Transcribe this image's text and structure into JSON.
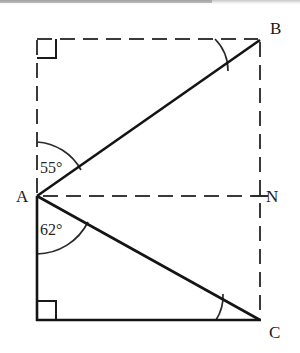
{
  "figure": {
    "kind": "geometry-diagram",
    "title": "",
    "background_color": "#ffffff",
    "stroke_color": "#1a1a1a",
    "dashed_color": "#3a3a3a",
    "vertices": [
      {
        "id": "A",
        "label": "A",
        "x": 37,
        "y": 196
      },
      {
        "id": "B",
        "label": "B",
        "x": 260,
        "y": 40
      },
      {
        "id": "C",
        "label": "C",
        "x": 260,
        "y": 320
      },
      {
        "id": "N",
        "label": "N",
        "x": 260,
        "y": 196
      },
      {
        "id": "T",
        "label": "",
        "x": 37,
        "y": 39
      },
      {
        "id": "D",
        "label": "",
        "x": 37,
        "y": 320
      }
    ],
    "solid_segments": [
      {
        "name": "segment-AB",
        "from": "A",
        "to": "B"
      },
      {
        "name": "segment-AC",
        "from": "A",
        "to": "C"
      },
      {
        "name": "segment-AD",
        "from": "A",
        "to": "D"
      },
      {
        "name": "segment-DC",
        "from": "D",
        "to": "C"
      }
    ],
    "dashed_segments": [
      {
        "name": "segment-T-to-B-top",
        "from": "T",
        "to": "B"
      },
      {
        "name": "segment-T-to-A-left",
        "from": "T",
        "to": "A"
      },
      {
        "name": "segment-A-to-N",
        "from": "A",
        "to": "N"
      },
      {
        "name": "segment-B-to-C-right",
        "from": "B",
        "to": "C"
      }
    ],
    "right_angle_markers": [
      {
        "name": "right-angle-marker-top-left",
        "x": 37,
        "y": 39,
        "size": 19,
        "dir_x": 1,
        "dir_y": 1
      },
      {
        "name": "right-angle-marker-bottom-left",
        "x": 37,
        "y": 320,
        "size": 19,
        "dir_x": 1,
        "dir_y": -1
      }
    ],
    "angle_arcs": [
      {
        "name": "angle-arc-at-A-upper",
        "vertex": "A",
        "radius": 54,
        "value": "55°"
      },
      {
        "name": "angle-arc-at-A-lower",
        "vertex": "A",
        "radius": 58,
        "value": "62°"
      },
      {
        "name": "angle-arc-at-B",
        "vertex": "B",
        "radius": 45,
        "value": ""
      },
      {
        "name": "angle-arc-at-C",
        "vertex": "C",
        "radius": 44,
        "value": ""
      }
    ],
    "angle_labels": [
      {
        "name": "angle-label-55",
        "text": "55°",
        "at_vertex": "A",
        "x": 40,
        "y": 160
      },
      {
        "name": "angle-label-62",
        "text": "62°",
        "at_vertex": "A",
        "x": 40,
        "y": 222
      }
    ],
    "vertex_labels": [
      {
        "name": "vertex-label-A",
        "text": "A"
      },
      {
        "name": "vertex-label-B",
        "text": "B"
      },
      {
        "name": "vertex-label-C",
        "text": "C"
      },
      {
        "name": "vertex-label-N",
        "text": "N"
      }
    ],
    "tick_marks": [
      {
        "name": "tick-mark-at-N",
        "x": 260,
        "y": 196
      }
    ]
  }
}
